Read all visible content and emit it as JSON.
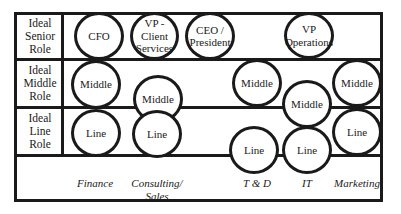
{
  "diagram": {
    "rows": [
      {
        "label": "Ideal Senior Role",
        "lines": [
          "Ideal",
          "Senior",
          "Role"
        ]
      },
      {
        "label": "Ideal Middle Role",
        "lines": [
          "Ideal",
          "Middle",
          "Role"
        ]
      },
      {
        "label": "Ideal Line Role",
        "lines": [
          "Ideal",
          "Line",
          "Role"
        ]
      }
    ],
    "departments": [
      {
        "label": "Finance",
        "lines": [
          "Finance"
        ]
      },
      {
        "label": "Consulting/ Sales",
        "lines": [
          "Consulting/",
          "Sales"
        ]
      },
      {
        "label": "T & D",
        "lines": [
          "T & D"
        ]
      },
      {
        "label": "IT",
        "lines": [
          "IT"
        ]
      },
      {
        "label": "Marketing",
        "lines": [
          "Marketing"
        ]
      }
    ],
    "senior_roles": [
      {
        "label": "CFO",
        "lines": [
          "CFO"
        ]
      },
      {
        "label": "VP - Client Services",
        "lines": [
          "VP -",
          "Client",
          "Services"
        ]
      },
      {
        "label": "CEO / President",
        "lines": [
          "CEO /",
          "President"
        ]
      },
      {
        "label": "VP Operations",
        "lines": [
          "VP",
          "Operations"
        ]
      }
    ],
    "middle_roles": [
      {
        "department": "Finance",
        "label": "Middle"
      },
      {
        "department": "Consulting/ Sales",
        "label": "Middle"
      },
      {
        "department": "T & D",
        "label": "Middle"
      },
      {
        "department": "IT",
        "label": "Middle"
      },
      {
        "department": "Marketing",
        "label": "Middle"
      }
    ],
    "line_roles": [
      {
        "department": "Finance",
        "label": "Line"
      },
      {
        "department": "Consulting/ Sales",
        "label": "Line"
      },
      {
        "department": "T & D",
        "label": "Line"
      },
      {
        "department": "IT",
        "label": "Line"
      },
      {
        "department": "Marketing",
        "label": "Line"
      }
    ],
    "colors": {
      "stroke": "#1a1a1a",
      "background": "#ffffff"
    }
  }
}
